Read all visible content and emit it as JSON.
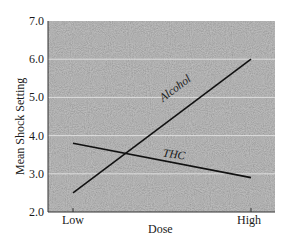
{
  "chart_data": {
    "type": "line",
    "title": "",
    "xlabel": "Dose",
    "ylabel": "Mean Shock Setting",
    "categories": [
      "Low",
      "High"
    ],
    "series": [
      {
        "name": "Alcohol",
        "values": [
          2.5,
          6.0
        ]
      },
      {
        "name": "THC",
        "values": [
          3.8,
          2.9
        ]
      }
    ],
    "ylim": [
      2.0,
      7.0
    ],
    "yticks": [
      "2.0",
      "3.0",
      "4.0",
      "5.0",
      "6.0",
      "7.0"
    ],
    "grid": true,
    "legend": "inline labels on lines",
    "background": "stippled gray"
  },
  "colors": {
    "plot_bg": "#a9a9a9",
    "gridline": "#e6e6e6",
    "line": "#111111"
  }
}
